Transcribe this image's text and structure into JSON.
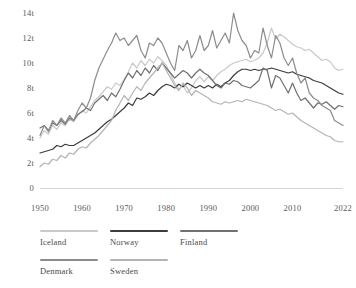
{
  "chart_data": {
    "type": "line",
    "title": "",
    "subtitle": "",
    "xlabel": "",
    "ylabel": "",
    "xlim": [
      1950,
      2022
    ],
    "ylim": [
      0,
      14
    ],
    "grid": false,
    "legend_position": "bottom-left",
    "y_ticks": [
      "0",
      "2t",
      "4t",
      "6t",
      "8t",
      "10t",
      "12t",
      "14t"
    ],
    "y_tick_values": [
      0,
      2,
      4,
      6,
      8,
      10,
      12,
      14
    ],
    "x_ticks": [
      "1950",
      "1960",
      "1970",
      "1980",
      "1990",
      "2000",
      "2010",
      "2022"
    ],
    "x_tick_values": [
      1950,
      1960,
      1970,
      1980,
      1990,
      2000,
      2010,
      2022
    ],
    "x": [
      1950,
      1951,
      1952,
      1953,
      1954,
      1955,
      1956,
      1957,
      1958,
      1959,
      1960,
      1961,
      1962,
      1963,
      1964,
      1965,
      1966,
      1967,
      1968,
      1969,
      1970,
      1971,
      1972,
      1973,
      1974,
      1975,
      1976,
      1977,
      1978,
      1979,
      1980,
      1981,
      1982,
      1983,
      1984,
      1985,
      1986,
      1987,
      1988,
      1989,
      1990,
      1991,
      1992,
      1993,
      1994,
      1995,
      1996,
      1997,
      1998,
      1999,
      2000,
      2001,
      2002,
      2003,
      2004,
      2005,
      2006,
      2007,
      2008,
      2009,
      2010,
      2011,
      2012,
      2013,
      2014,
      2015,
      2016,
      2017,
      2018,
      2019,
      2020,
      2021,
      2022
    ],
    "series": [
      {
        "name": "Iceland",
        "color": "#c9c9c9",
        "values": [
          4.0,
          4.6,
          4.3,
          5.0,
          4.7,
          5.2,
          5.0,
          5.5,
          5.3,
          5.8,
          6.2,
          6.0,
          6.5,
          7.0,
          7.3,
          7.7,
          8.1,
          7.9,
          8.4,
          8.2,
          8.7,
          9.3,
          10.0,
          9.6,
          10.2,
          9.8,
          10.3,
          10.0,
          10.5,
          10.2,
          9.8,
          9.1,
          8.4,
          7.9,
          8.2,
          7.6,
          8.0,
          8.6,
          8.9,
          8.5,
          8.9,
          8.6,
          9.0,
          9.3,
          9.5,
          9.8,
          10.0,
          10.1,
          10.2,
          10.3,
          10.1,
          10.2,
          10.4,
          10.8,
          11.6,
          12.8,
          11.9,
          12.3,
          12.1,
          11.8,
          11.5,
          11.3,
          11.2,
          11.0,
          11.1,
          10.8,
          10.5,
          10.2,
          10.3,
          10.1,
          9.6,
          9.4,
          9.5
        ],
        "end_value": 9.5
      },
      {
        "name": "Norway",
        "color": "#3c3c3c",
        "values": [
          2.8,
          2.9,
          3.0,
          3.1,
          3.4,
          3.3,
          3.5,
          3.4,
          3.4,
          3.6,
          3.8,
          4.0,
          4.2,
          4.4,
          4.7,
          5.0,
          5.3,
          5.5,
          5.8,
          6.1,
          6.4,
          6.8,
          6.6,
          7.2,
          7.1,
          7.3,
          7.6,
          7.4,
          7.8,
          8.1,
          8.3,
          8.2,
          8.0,
          8.3,
          8.1,
          8.4,
          8.2,
          8.0,
          8.2,
          8.0,
          8.2,
          8.0,
          8.3,
          8.1,
          8.4,
          8.6,
          9.0,
          9.3,
          9.5,
          9.5,
          9.4,
          9.5,
          9.4,
          9.5,
          9.5,
          9.6,
          9.5,
          9.4,
          9.3,
          9.2,
          9.3,
          9.1,
          9.0,
          8.9,
          8.8,
          8.6,
          8.5,
          8.4,
          8.2,
          8.0,
          7.8,
          7.6,
          7.5
        ],
        "end_value": 7.5
      },
      {
        "name": "Finland",
        "color": "#707070",
        "values": [
          4.8,
          5.0,
          4.6,
          5.2,
          5.0,
          5.4,
          5.1,
          5.6,
          5.4,
          5.9,
          6.1,
          6.4,
          6.2,
          6.8,
          7.1,
          7.4,
          7.0,
          7.6,
          7.3,
          7.9,
          8.6,
          9.2,
          8.8,
          9.4,
          9.0,
          9.6,
          9.2,
          9.8,
          9.4,
          10.0,
          9.6,
          9.2,
          8.8,
          9.1,
          9.4,
          9.2,
          8.8,
          9.2,
          9.5,
          9.2,
          9.0,
          8.6,
          8.2,
          8.0,
          8.4,
          8.3,
          8.6,
          8.5,
          8.2,
          8.1,
          8.0,
          8.3,
          8.6,
          9.6,
          9.4,
          8.0,
          9.0,
          8.8,
          8.2,
          7.6,
          8.4,
          7.6,
          7.0,
          7.2,
          6.8,
          6.4,
          6.8,
          6.7,
          6.9,
          6.6,
          6.3,
          6.6,
          6.5
        ],
        "end_value": 6.5
      },
      {
        "name": "Denmark",
        "color": "#8c8c8c",
        "values": [
          4.2,
          5.0,
          4.5,
          5.4,
          5.0,
          5.6,
          5.2,
          5.8,
          5.4,
          6.2,
          6.8,
          6.4,
          7.2,
          8.6,
          9.6,
          10.3,
          11.0,
          11.6,
          12.4,
          11.8,
          12.0,
          11.4,
          11.8,
          12.2,
          11.0,
          10.4,
          11.6,
          11.4,
          12.0,
          11.6,
          10.8,
          10.0,
          9.4,
          11.4,
          11.0,
          11.8,
          10.4,
          11.0,
          12.2,
          11.0,
          11.4,
          12.6,
          11.2,
          11.8,
          12.4,
          11.6,
          14.0,
          12.6,
          11.8,
          11.4,
          10.4,
          11.0,
          10.8,
          12.8,
          11.4,
          10.4,
          12.2,
          11.6,
          10.4,
          9.8,
          10.4,
          9.2,
          8.4,
          8.8,
          7.6,
          7.2,
          7.0,
          6.6,
          6.4,
          6.2,
          5.4,
          5.2,
          5.0
        ],
        "end_value": 5.0
      },
      {
        "name": "Sweden",
        "color": "#b4b4b4",
        "values": [
          1.7,
          2.0,
          1.9,
          2.3,
          2.2,
          2.6,
          2.4,
          2.8,
          2.7,
          3.1,
          3.3,
          3.2,
          3.6,
          3.9,
          4.2,
          4.6,
          5.0,
          5.4,
          6.2,
          6.8,
          7.4,
          7.0,
          7.6,
          8.1,
          7.8,
          8.4,
          8.8,
          9.2,
          9.6,
          10.0,
          9.4,
          8.8,
          8.2,
          7.8,
          8.4,
          8.0,
          7.4,
          7.8,
          7.6,
          7.4,
          7.2,
          6.9,
          6.8,
          6.7,
          6.9,
          6.8,
          6.9,
          7.0,
          6.9,
          7.1,
          7.0,
          6.9,
          6.8,
          6.7,
          6.6,
          6.4,
          6.2,
          6.3,
          6.1,
          5.9,
          6.0,
          5.7,
          5.4,
          5.2,
          5.0,
          4.8,
          4.6,
          4.4,
          4.2,
          4.1,
          3.8,
          3.7,
          3.7
        ],
        "end_value": 3.7
      }
    ]
  },
  "legend": {
    "rows": [
      [
        {
          "label": "Iceland",
          "color": "#c9c9c9"
        },
        {
          "label": "Norway",
          "color": "#3c3c3c"
        },
        {
          "label": "Finland",
          "color": "#707070"
        }
      ],
      [
        {
          "label": "Denmark",
          "color": "#8c8c8c"
        },
        {
          "label": "Sweden",
          "color": "#b4b4b4"
        }
      ]
    ]
  },
  "axis": {
    "baseline_color": "#d6d6d6"
  }
}
